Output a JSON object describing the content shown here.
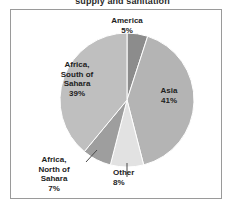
{
  "title": "supply and sanitation",
  "chart_data": {
    "type": "pie",
    "title": "supply and sanitation",
    "categories": [
      "America",
      "Asia",
      "Other",
      "Africa, North of Sahara",
      "Africa, South of Sahara"
    ],
    "values": [
      5,
      41,
      8,
      7,
      39
    ],
    "unit": "%",
    "legend": "none",
    "labels_position": "inside-and-callout",
    "start_angle_deg": 0,
    "direction": "clockwise",
    "slices": [
      {
        "name": "America",
        "label": "America",
        "percent_label": "5%",
        "value": 5,
        "color": "#8c8c8c",
        "label_placement": "outside-top",
        "leader_line": false
      },
      {
        "name": "Asia",
        "label": "Asia",
        "percent_label": "41%",
        "value": 41,
        "color": "#b4b4b4",
        "label_placement": "inside",
        "leader_line": false
      },
      {
        "name": "Other",
        "label": "Other",
        "percent_label": "8%",
        "value": 8,
        "color": "#e2e2e2",
        "label_placement": "outside-bottom",
        "leader_line": true
      },
      {
        "name": "Africa, North of Sahara",
        "label_line1": "Africa,",
        "label_line2": "North of",
        "label_line3": "Sahara",
        "percent_label": "7%",
        "value": 7,
        "color": "#9e9e9e",
        "label_placement": "outside-bottom-left",
        "leader_line": true
      },
      {
        "name": "Africa, South of Sahara",
        "label_line1": "Africa,",
        "label_line2": "South of",
        "label_line3": "Sahara",
        "percent_label": "39%",
        "value": 39,
        "color": "#bfbfbf",
        "label_placement": "inside",
        "leader_line": false
      }
    ],
    "colors": {
      "america": "#8c8c8c",
      "asia": "#b4b4b4",
      "other": "#e2e2e2",
      "africa_north": "#9e9e9e",
      "africa_south": "#bfbfbf",
      "slice_outline": "#ffffff",
      "frame_border": "#9a9a9a",
      "text": "#1d1d1d",
      "background": "#ffffff"
    }
  }
}
